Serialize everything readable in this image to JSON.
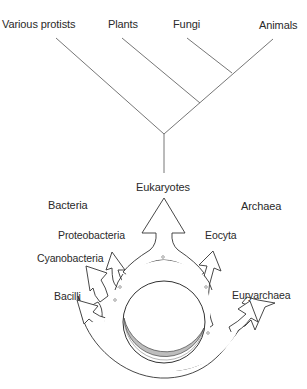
{
  "tree": {
    "leaves": [
      {
        "label": "Various protists"
      },
      {
        "label": "Plants"
      },
      {
        "label": "Fungi"
      },
      {
        "label": "Animals"
      }
    ],
    "root_label": "Eukaryotes"
  },
  "ring": {
    "domain_labels": {
      "left": "Bacteria",
      "right": "Archaea"
    },
    "branches": [
      {
        "label": "Proteobacteria",
        "side": "left"
      },
      {
        "label": "Cyanobacteria",
        "side": "left"
      },
      {
        "label": "Bacilli",
        "side": "left"
      },
      {
        "label": "Eocyta",
        "side": "right"
      },
      {
        "label": "Euryarchaea",
        "side": "right"
      }
    ]
  },
  "colors": {
    "line": "#555555",
    "text": "#2a2a2a",
    "hatch": "#9a9a9a",
    "background": "#ffffff"
  }
}
